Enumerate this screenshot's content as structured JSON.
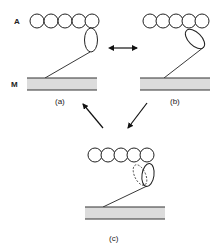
{
  "labels": {
    "actin": "A",
    "membrane": "M"
  },
  "panels": [
    {
      "id": "a",
      "caption": "(a)",
      "bead_count": 5,
      "head_state": "attached-upright"
    },
    {
      "id": "b",
      "caption": "(b)",
      "bead_count": 5,
      "head_state": "tilted"
    },
    {
      "id": "c",
      "caption": "(c)",
      "bead_count": 5,
      "head_state": "upright-with-alternate-dashed"
    }
  ],
  "transitions": [
    {
      "from": "a",
      "to": "b",
      "type": "reversible"
    },
    {
      "from": "b",
      "to": "c",
      "type": "forward"
    },
    {
      "from": "c",
      "to": "a",
      "type": "forward"
    }
  ],
  "colors": {
    "line": "#222222",
    "membrane_fill": "#dcdcdc",
    "background": "#ffffff"
  }
}
